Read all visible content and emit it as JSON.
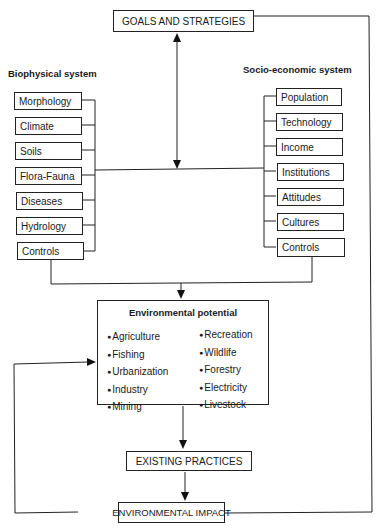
{
  "goals": "GOALS AND STRATEGIES",
  "biophysical": {
    "heading": "Biophysical system",
    "items": [
      "Morphology",
      "Climate",
      "Soils",
      "Flora-Fauna",
      "Diseases",
      "Hydrology",
      "Controls"
    ]
  },
  "socioeconomic": {
    "heading": "Socio-economic system",
    "items": [
      "Population",
      "Technology",
      "Income",
      "Institutions",
      "Attitudes",
      "Cultures",
      "Controls"
    ]
  },
  "potential": {
    "title": "Environmental potential",
    "left": [
      "Agriculture",
      "Fishing",
      "Urbanization",
      "Industry",
      "Mining"
    ],
    "right": [
      "Recreation",
      "Wildlife",
      "Forestry",
      "Electricity",
      "Livestock"
    ]
  },
  "practices": "EXISTING PRACTICES",
  "impact": "ENVIRONMENTAL IMPACT"
}
